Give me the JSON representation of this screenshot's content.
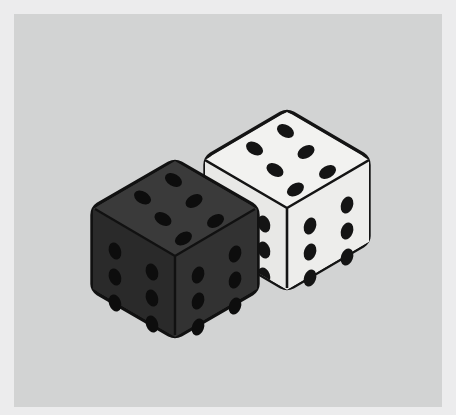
{
  "scene": {
    "title": "Two dice illustration",
    "width": 456,
    "height": 415,
    "background_color": "#ececed",
    "panel_color": "#d2d3d3",
    "panel_margin_px": 14,
    "style": "flat vector isometric illustration"
  },
  "palette": {
    "outer_border": "#ececed",
    "panel_background": "#d2d3d3",
    "dark_die_top": "#3a3a3a",
    "dark_die_left": "#2a2a2a",
    "dark_die_right": "#323232",
    "dark_die_outline": "#111111",
    "dark_die_pip": "#0d0d0d",
    "white_die_top": "#f2f2f0",
    "white_die_left": "#e8e8e6",
    "white_die_right": "#ededeb",
    "white_die_outline": "#141414",
    "white_die_pip": "#141414"
  },
  "dice": [
    {
      "name": "dark-die",
      "color_label": "black",
      "position": "front-left",
      "total_visible_pips": 18,
      "faces": [
        {
          "name": "top",
          "value": 6,
          "pip_layout": "two-columns-of-three"
        },
        {
          "name": "left",
          "value": 6,
          "pip_layout": "two-columns-of-three"
        },
        {
          "name": "right",
          "value": 6,
          "pip_layout": "two-columns-of-three"
        }
      ],
      "geometry": {
        "center_x": 175,
        "top_vertex": [
          175,
          160
        ],
        "left_vertex": [
          92,
          208
        ],
        "right_vertex": [
          258,
          208
        ],
        "middle_vertex": [
          175,
          256
        ],
        "bottom_vertex": [
          175,
          338
        ],
        "left_bottom_vertex": [
          92,
          290
        ],
        "right_bottom_vertex": [
          258,
          290
        ]
      }
    },
    {
      "name": "white-die",
      "color_label": "white",
      "position": "back-right",
      "total_visible_pips": 18,
      "faces": [
        {
          "name": "top",
          "value": 6,
          "pip_layout": "two-columns-of-three"
        },
        {
          "name": "left",
          "value": 6,
          "pip_layout": "two-columns-of-three",
          "occluded": true
        },
        {
          "name": "right",
          "value": 6,
          "pip_layout": "two-columns-of-three"
        }
      ],
      "geometry": {
        "center_x": 287,
        "top_vertex": [
          287,
          110
        ],
        "left_vertex": [
          205,
          158
        ],
        "right_vertex": [
          369,
          158
        ],
        "middle_vertex": [
          287,
          206
        ],
        "bottom_vertex": [
          287,
          290
        ],
        "left_bottom_vertex": [
          205,
          242
        ],
        "right_bottom_vertex": [
          369,
          242
        ]
      }
    }
  ],
  "summary": {
    "dice_count": 2,
    "visible_value_each_face": 6,
    "total_shown": 36
  }
}
